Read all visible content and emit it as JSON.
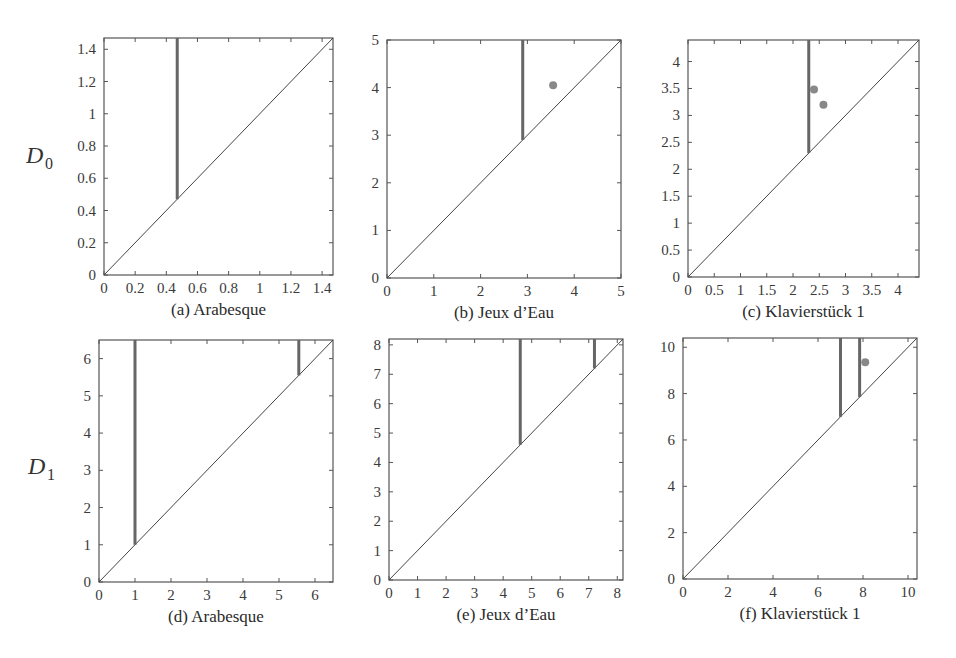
{
  "figure": {
    "row_labels": [
      {
        "main": "D",
        "sub": "0"
      },
      {
        "main": "D",
        "sub": "1"
      }
    ]
  },
  "colors": {
    "axis": "#555555",
    "diagonal": "#444444",
    "bar": "#666666",
    "point": "#888888"
  },
  "chart_data": [
    {
      "type": "scatter",
      "title": "(a) Arabesque",
      "row": "D0",
      "xlim": [
        0,
        1.47
      ],
      "ylim": [
        0,
        1.47
      ],
      "xticks": [
        0,
        0.2,
        0.4,
        0.6,
        0.8,
        1,
        1.2,
        1.4
      ],
      "xtick_labels": [
        "0",
        "0.2",
        "0.4",
        "0.6",
        "0.8",
        "1",
        "1.2",
        "1.4"
      ],
      "yticks": [
        0,
        0.2,
        0.4,
        0.6,
        0.8,
        1,
        1.2,
        1.4
      ],
      "ytick_labels": [
        "0",
        "0.2",
        "0.4",
        "0.6",
        "0.8",
        "1",
        "1.2",
        "1.4"
      ],
      "diagonal": true,
      "infinite_bars": [
        0.47
      ],
      "points": []
    },
    {
      "type": "scatter",
      "title": "(b) Jeux d’Eau",
      "row": "D0",
      "xlim": [
        0,
        5
      ],
      "ylim": [
        0,
        5
      ],
      "xticks": [
        0,
        1,
        2,
        3,
        4,
        5
      ],
      "xtick_labels": [
        "0",
        "1",
        "2",
        "3",
        "4",
        "5"
      ],
      "yticks": [
        0,
        1,
        2,
        3,
        4,
        5
      ],
      "ytick_labels": [
        "0",
        "1",
        "2",
        "3",
        "4",
        "5"
      ],
      "diagonal": true,
      "infinite_bars": [
        2.9
      ],
      "points": [
        [
          3.55,
          4.05
        ]
      ]
    },
    {
      "type": "scatter",
      "title": "(c) Klavierstück 1",
      "row": "D0",
      "xlim": [
        0,
        4.4
      ],
      "ylim": [
        0,
        4.4
      ],
      "xticks": [
        0,
        0.5,
        1,
        1.5,
        2,
        2.5,
        3,
        3.5,
        4
      ],
      "xtick_labels": [
        "0",
        "0.5",
        "1",
        "1.5",
        "2",
        "2.5",
        "3",
        "3.5",
        "4"
      ],
      "yticks": [
        0,
        0.5,
        1,
        1.5,
        2,
        2.5,
        3,
        3.5,
        4
      ],
      "ytick_labels": [
        "0",
        "0.5",
        "1",
        "1.5",
        "2",
        "2.5",
        "3",
        "3.5",
        "4"
      ],
      "diagonal": true,
      "infinite_bars": [
        2.3
      ],
      "points": [
        [
          2.4,
          3.48
        ],
        [
          2.58,
          3.2
        ]
      ]
    },
    {
      "type": "scatter",
      "title": "(d) Arabesque",
      "row": "D1",
      "xlim": [
        0,
        6.5
      ],
      "ylim": [
        0,
        6.5
      ],
      "xticks": [
        0,
        1,
        2,
        3,
        4,
        5,
        6
      ],
      "xtick_labels": [
        "0",
        "1",
        "2",
        "3",
        "4",
        "5",
        "6"
      ],
      "yticks": [
        0,
        1,
        2,
        3,
        4,
        5,
        6
      ],
      "ytick_labels": [
        "0",
        "1",
        "2",
        "3",
        "4",
        "5",
        "6"
      ],
      "diagonal": true,
      "infinite_bars": [
        1.0,
        5.55
      ],
      "points": []
    },
    {
      "type": "scatter",
      "title": "(e) Jeux d’Eau",
      "row": "D1",
      "xlim": [
        0,
        8.2
      ],
      "ylim": [
        0,
        8.2
      ],
      "xticks": [
        0,
        1,
        2,
        3,
        4,
        5,
        6,
        7,
        8
      ],
      "xtick_labels": [
        "0",
        "1",
        "2",
        "3",
        "4",
        "5",
        "6",
        "7",
        "8"
      ],
      "yticks": [
        0,
        1,
        2,
        3,
        4,
        5,
        6,
        7,
        8
      ],
      "ytick_labels": [
        "0",
        "1",
        "2",
        "3",
        "4",
        "5",
        "6",
        "7",
        "8"
      ],
      "diagonal": true,
      "infinite_bars": [
        4.6,
        7.2
      ],
      "points": []
    },
    {
      "type": "scatter",
      "title": "(f) Klavierstück 1",
      "row": "D1",
      "xlim": [
        0,
        10.4
      ],
      "ylim": [
        0,
        10.4
      ],
      "xticks": [
        0,
        2,
        4,
        6,
        8,
        10
      ],
      "xtick_labels": [
        "0",
        "2",
        "4",
        "6",
        "8",
        "10"
      ],
      "yticks": [
        0,
        2,
        4,
        6,
        8,
        10
      ],
      "ytick_labels": [
        "0",
        "2",
        "4",
        "6",
        "8",
        "10"
      ],
      "diagonal": true,
      "infinite_bars": [
        7.0,
        7.85
      ],
      "points": [
        [
          8.1,
          9.35
        ]
      ]
    }
  ]
}
